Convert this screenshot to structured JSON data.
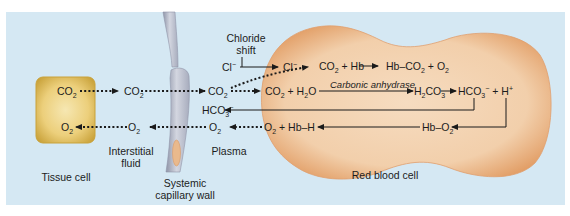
{
  "colors": {
    "background_panel": "#d5e8f3",
    "tissue_cell_fill": "#e6c870",
    "tissue_cell_edge": "#c9a23a",
    "rbc_fill": "#f3d2b0",
    "rbc_edge": "#e0a070",
    "capillary_fill": "#c4c8d6",
    "capillary_edge": "#9096aa",
    "capillary_nucleus": "#e9b98c",
    "arrow": "#1a1a1a"
  },
  "labels": {
    "tissue_cell": "Tissue cell",
    "interstitial_fluid_line1": "Interstitial",
    "interstitial_fluid_line2": "fluid",
    "capillary_wall_line1": "Systemic",
    "capillary_wall_line2": "capillary wall",
    "plasma": "Plasma",
    "red_blood_cell": "Red blood cell",
    "chloride_shift_line1": "Chloride",
    "chloride_shift_line2": "shift",
    "enzyme": "Carbonic anhydrase"
  },
  "species": {
    "tissue_co2": {
      "base": "CO",
      "sub": "2"
    },
    "tissue_o2": {
      "base": "O",
      "sub": "2"
    },
    "interstitial_co2": {
      "base": "CO",
      "sub": "2"
    },
    "interstitial_o2": {
      "base": "O",
      "sub": "2"
    },
    "plasma_co2": {
      "base": "CO",
      "sub": "2"
    },
    "plasma_hco3": {
      "base": "HCO",
      "sub": "3",
      "sup": "−"
    },
    "plasma_o2": {
      "base": "O",
      "sub": "2"
    },
    "plasma_cl": {
      "base": "Cl",
      "sup": "−"
    },
    "rbc_cl": {
      "base": "Cl",
      "sup": "−"
    }
  },
  "reactions": {
    "hb_binding": {
      "lhs": [
        "CO₂",
        "+ Hb"
      ],
      "product": [
        "Hb–CO₂",
        "+ O₂"
      ]
    },
    "carbonic": {
      "lhs": "CO₂ + H₂O",
      "intermediate": "H₂CO₃",
      "products": [
        "HCO₃⁻",
        "+ H⁺"
      ]
    },
    "oxy_release": {
      "source": "Hb–O₂",
      "products": "O₂ + Hb–H"
    }
  },
  "text_rows": {
    "hb_co2_left": "CO",
    "hb_co2_left_sub": "2",
    "hb_co2_plus": " + Hb",
    "hb_co2_right": "Hb–CO",
    "hb_co2_right_sub": "2",
    "hb_co2_right_tail": " + O",
    "hb_co2_right_tail_sub": "2",
    "rxn_co2": "CO",
    "rxn_co2_sub": "2",
    "rxn_plus_h2o": " + H",
    "rxn_h2o_sub": "2",
    "rxn_h2o_o": "O",
    "h2co3_h": "H",
    "h2co3_sub1": "2",
    "h2co3_co": "CO",
    "h2co3_sub2": "3",
    "hco3": "HCO",
    "hco3_sub": "3",
    "hco3_sup": "−",
    "plus_h": " + H",
    "h_sup": "+",
    "hbo2": "Hb–O",
    "hbo2_sub": "2",
    "o2_hbh_o": "O",
    "o2_hbh_sub": "2",
    "o2_hbh_tail": " + Hb–H"
  }
}
